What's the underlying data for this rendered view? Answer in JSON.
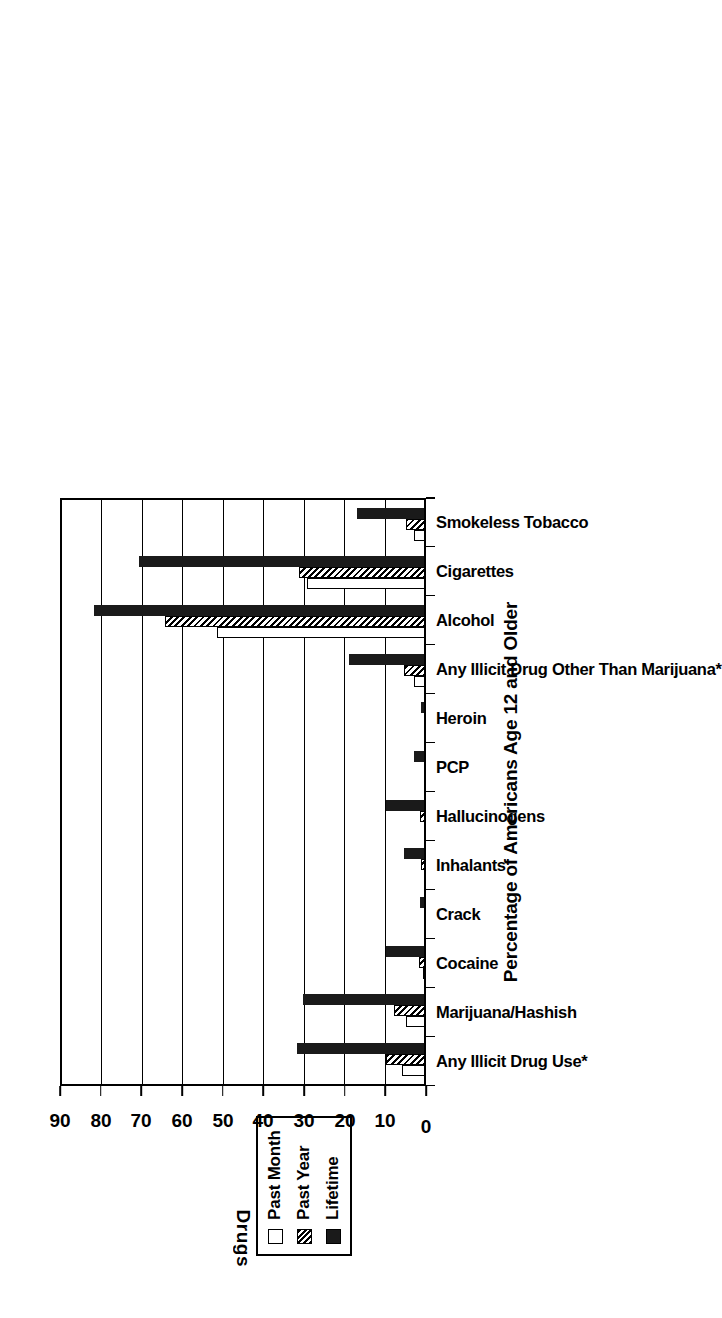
{
  "chart": {
    "type": "bar",
    "orientation": "rotated-90",
    "value_axis_title": "Percentage of Americans Age 12 and Older",
    "category_axis_title": "Drugs"
  },
  "legend": {
    "items": [
      {
        "label": "Past Month",
        "swatch": "empty-square-icon",
        "color": "#ffffff"
      },
      {
        "label": "Past Year",
        "swatch": "hatched-square-icon",
        "color": "#808080"
      },
      {
        "label": "Lifetime",
        "swatch": "filled-square-icon",
        "color": "#1a1a1a"
      }
    ]
  },
  "axis": {
    "ticks": [
      "0",
      "10",
      "20",
      "30",
      "40",
      "50",
      "60",
      "70",
      "80",
      "90"
    ]
  },
  "chart_data": {
    "type": "bar",
    "title": "",
    "xlabel": "Drugs",
    "ylabel": "Percentage of Americans Age 12 and Older",
    "ylim": [
      0,
      90
    ],
    "ytick_step": 10,
    "grid": true,
    "legend_position": "top-outside",
    "categories": [
      "Any Illicit Drug Use*",
      "Marijuana/Hashish",
      "Cocaine",
      "Crack",
      "Inhalants",
      "Hallucinogens",
      "PCP",
      "Heroin",
      "Any Illicit Drug Other Than Marijuana*",
      "Alcohol",
      "Cigarettes",
      "Smokeless Tobacco"
    ],
    "series": [
      {
        "name": "Past Month",
        "values": [
          6.0,
          5.0,
          0.8,
          0.2,
          0.4,
          0.5,
          0.0,
          0.1,
          3.0,
          51.7,
          29.5,
          3.0
        ]
      },
      {
        "name": "Past Year",
        "values": [
          10.0,
          8.0,
          1.8,
          0.5,
          1.2,
          1.5,
          0.1,
          0.2,
          5.5,
          64.5,
          31.5,
          5.0
        ]
      },
      {
        "name": "Lifetime",
        "values": [
          32.0,
          30.5,
          10.0,
          1.5,
          5.5,
          9.8,
          3.0,
          1.2,
          19.0,
          82.0,
          71.0,
          17.0
        ]
      }
    ]
  }
}
